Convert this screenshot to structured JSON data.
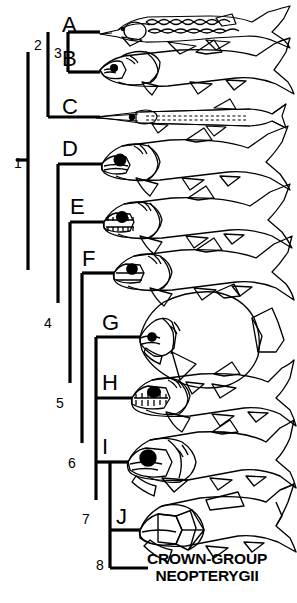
{
  "figure": {
    "kind": "cladogram",
    "background_color": "#ffffff",
    "line_color": "#000000",
    "caption": {
      "line1": "CROWN-GROUP",
      "line2": "NEOPTERYGII"
    }
  },
  "taxa": [
    {
      "letter": "A",
      "label_x": 62,
      "label_y": 14,
      "tip_y": 32,
      "branch_x": 68,
      "fish": "sturgeon-scutes"
    },
    {
      "letter": "B",
      "label_x": 62,
      "label_y": 48,
      "tip_y": 72,
      "branch_x": 68,
      "fish": "robust-deep-head"
    },
    {
      "letter": "C",
      "label_x": 62,
      "label_y": 96,
      "tip_y": 117,
      "branch_x": 48,
      "fish": "elongate-needle"
    },
    {
      "letter": "D",
      "label_x": 62,
      "label_y": 138,
      "tip_y": 164,
      "branch_x": 58,
      "fish": "big-eye-predator"
    },
    {
      "letter": "E",
      "label_x": 70,
      "label_y": 196,
      "tip_y": 222,
      "branch_x": 70,
      "fish": "toothy-slender"
    },
    {
      "letter": "F",
      "label_x": 82,
      "label_y": 248,
      "tip_y": 273,
      "branch_x": 82,
      "fish": "blunt-head-trout"
    },
    {
      "letter": "G",
      "label_x": 102,
      "label_y": 312,
      "tip_y": 337,
      "branch_x": 96,
      "fish": "deep-bodied-disc"
    },
    {
      "letter": "H",
      "label_x": 102,
      "label_y": 372,
      "tip_y": 398,
      "branch_x": 96,
      "fish": "long-jaw-pike"
    },
    {
      "letter": "I",
      "label_x": 102,
      "label_y": 436,
      "tip_y": 462,
      "branch_x": 96,
      "fish": "large-eye-bass"
    },
    {
      "letter": "J",
      "label_x": 116,
      "label_y": 506,
      "tip_y": 530,
      "branch_x": 110,
      "fish": "heavy-bodied-amia"
    }
  ],
  "nodes": [
    {
      "number": "1",
      "label_x": 14,
      "label_y": 156,
      "x": 28,
      "y_top": 52,
      "y_bottom": 270
    },
    {
      "number": "2",
      "label_x": 34,
      "label_y": 38,
      "x": 48,
      "y_top": 32,
      "y_bottom": 117
    },
    {
      "number": "3",
      "label_x": 54,
      "label_y": 46,
      "x": 68,
      "y_top": 32,
      "y_bottom": 72
    },
    {
      "number": "4",
      "label_x": 44,
      "label_y": 316,
      "x": 58,
      "y_top": 164,
      "y_bottom": 303
    },
    {
      "number": "5",
      "label_x": 56,
      "label_y": 396,
      "x": 70,
      "y_top": 222,
      "y_bottom": 383
    },
    {
      "number": "6",
      "label_x": 68,
      "label_y": 456,
      "x": 82,
      "y_top": 273,
      "y_bottom": 443
    },
    {
      "number": "7",
      "label_x": 82,
      "label_y": 512,
      "x": 96,
      "y_top": 337,
      "y_bottom": 500
    },
    {
      "number": "8",
      "label_x": 96,
      "label_y": 558,
      "x": 110,
      "y_top": 462,
      "y_bottom": 568
    }
  ],
  "tip_lines": [
    {
      "taxon": "A",
      "x1": 68,
      "x2": 100,
      "y": 32
    },
    {
      "taxon": "B",
      "x1": 68,
      "x2": 100,
      "y": 72
    },
    {
      "taxon": "C",
      "x1": 48,
      "x2": 100,
      "y": 117
    },
    {
      "taxon": "D",
      "x1": 58,
      "x2": 102,
      "y": 164
    },
    {
      "taxon": "E",
      "x1": 70,
      "x2": 104,
      "y": 222
    },
    {
      "taxon": "F",
      "x1": 82,
      "x2": 114,
      "y": 273
    },
    {
      "taxon": "G",
      "x1": 96,
      "x2": 140,
      "y": 337
    },
    {
      "taxon": "H",
      "x1": 96,
      "x2": 132,
      "y": 398
    },
    {
      "taxon": "I",
      "x1": 96,
      "x2": 128,
      "y": 462
    },
    {
      "taxon": "J",
      "x1": 110,
      "x2": 140,
      "y": 530
    },
    {
      "taxon": "crown",
      "x1": 110,
      "x2": 148,
      "y": 568
    }
  ],
  "root_stem": {
    "x1": 16,
    "x2": 28,
    "y": 160
  }
}
